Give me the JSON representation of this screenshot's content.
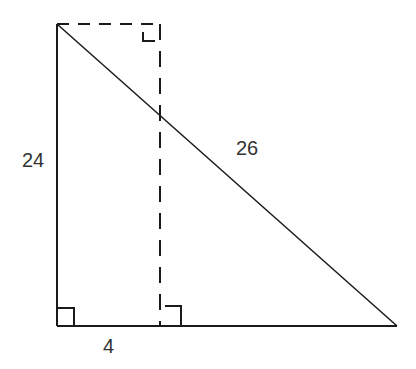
{
  "diagram": {
    "type": "geometry-right-triangle",
    "labels": {
      "left_side": "24",
      "hypotenuse": "26",
      "base_segment": "4"
    },
    "colors": {
      "stroke": "#1a1a1a",
      "text": "#333333",
      "background": "#ffffff"
    },
    "points": {
      "top_left": [
        57,
        24
      ],
      "bottom_left": [
        57,
        326
      ],
      "bottom_right": [
        397,
        326
      ],
      "dashed_top": [
        160,
        24
      ],
      "dashed_bottom": [
        160,
        326
      ]
    },
    "right_angle_markers": [
      "bottom-left",
      "dashed-base",
      "dashed-top-right"
    ]
  }
}
